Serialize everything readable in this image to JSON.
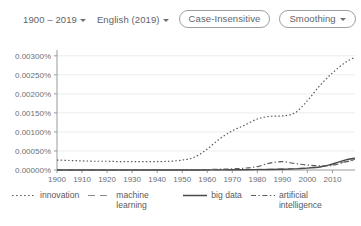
{
  "toolbar": {
    "year_range": {
      "label": "1900 – 2019",
      "icon": "chevron-down-icon"
    },
    "corpus": {
      "label": "English (2019)",
      "icon": "chevron-down-icon"
    },
    "case_sensitivity": {
      "label": "Case-Insensitive"
    },
    "smoothing": {
      "label": "Smoothing",
      "icon": "chevron-down-icon"
    }
  },
  "colors": {
    "axis": "#9a9a9a",
    "grid": "#ececec",
    "text": "#5f6368",
    "series": "#5a5a5a"
  },
  "chart_data": {
    "type": "line",
    "title": "",
    "xlabel": "",
    "ylabel": "",
    "grid": true,
    "legend_position": "bottom",
    "xlim": [
      1900,
      2019
    ],
    "ylim": [
      0,
      0.0031
    ],
    "x_ticks": [
      1900,
      1910,
      1920,
      1930,
      1940,
      1950,
      1960,
      1970,
      1980,
      1990,
      2000,
      2010
    ],
    "y_ticks": [
      0,
      0.0005,
      0.001,
      0.0015,
      0.002,
      0.0025,
      0.003
    ],
    "y_tick_labels": [
      "0.00000%",
      "0.00050%",
      "0.00100%",
      "0.00150%",
      "0.00200%",
      "0.00250%",
      "0.00300%"
    ],
    "y_unit": "percent-of-ngrams",
    "x": [
      1900,
      1905,
      1910,
      1915,
      1920,
      1925,
      1930,
      1935,
      1940,
      1945,
      1950,
      1955,
      1960,
      1965,
      1970,
      1975,
      1980,
      1985,
      1990,
      1995,
      2000,
      2005,
      2010,
      2015,
      2019
    ],
    "series": [
      {
        "name": "innovation",
        "style": "dotted",
        "color": "#5a5a5a",
        "values": [
          0.00026,
          0.00025,
          0.00024,
          0.00023,
          0.00023,
          0.00022,
          0.00022,
          0.00022,
          0.00022,
          0.00023,
          0.00026,
          0.00034,
          0.00055,
          0.00082,
          0.00103,
          0.00118,
          0.00134,
          0.00141,
          0.00142,
          0.0015,
          0.00182,
          0.00222,
          0.00255,
          0.00282,
          0.00296
        ]
      },
      {
        "name": "machine learning",
        "style": "dashed",
        "color": "#5a5a5a",
        "values": [
          0.0,
          0.0,
          0.0,
          0.0,
          0.0,
          0.0,
          0.0,
          0.0,
          0.0,
          0.0,
          0.0,
          0.0,
          2e-06,
          4e-06,
          6e-06,
          1e-05,
          1.5e-05,
          2e-05,
          3e-05,
          4e-05,
          6e-05,
          9e-05,
          0.00014,
          0.00022,
          0.00028
        ]
      },
      {
        "name": "big data",
        "style": "solid",
        "color": "#5a5a5a",
        "values": [
          0.0,
          0.0,
          0.0,
          0.0,
          0.0,
          0.0,
          0.0,
          0.0,
          0.0,
          0.0,
          0.0,
          1e-06,
          2e-06,
          3e-06,
          5e-06,
          7e-06,
          1e-05,
          1.4e-05,
          2e-05,
          3e-05,
          5e-05,
          8e-05,
          0.00016,
          0.00026,
          0.00031
        ]
      },
      {
        "name": "artificial intelligence",
        "style": "dashdot",
        "color": "#5a5a5a",
        "values": [
          0.0,
          0.0,
          0.0,
          0.0,
          0.0,
          0.0,
          0.0,
          0.0,
          0.0,
          0.0,
          0.0,
          2e-06,
          1e-05,
          2e-05,
          3e-05,
          5e-05,
          9e-05,
          0.00018,
          0.00022,
          0.00017,
          0.00013,
          0.00011,
          0.00012,
          0.00021,
          0.00026
        ]
      }
    ]
  }
}
